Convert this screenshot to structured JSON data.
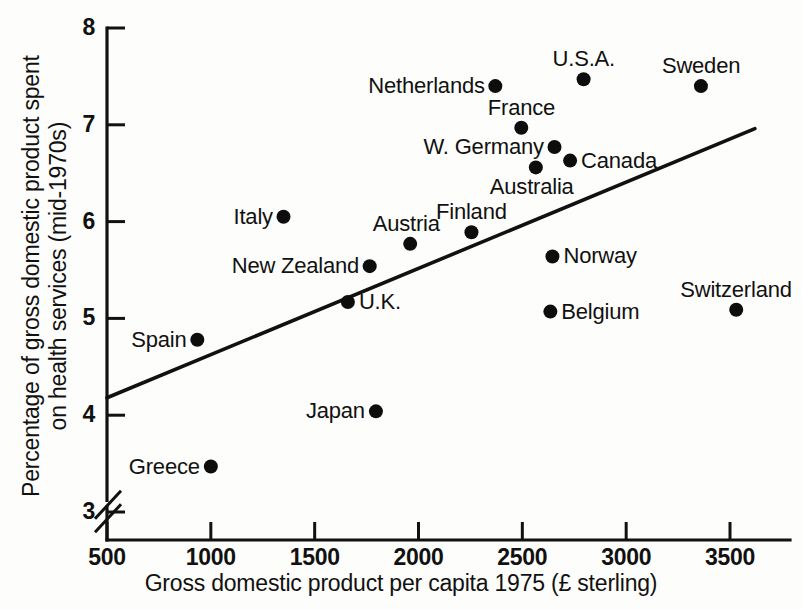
{
  "chart_data": {
    "type": "scatter",
    "title": "",
    "xlabel": "Gross domestic product per capita 1975 (£ sterling)",
    "ylabel": "Percentage of gross domestic product spent on health services (mid-1970s)",
    "ylabel_line1": "Percentage of gross domestic product spent",
    "ylabel_line2": "on health services (mid-1970s)",
    "xlim": [
      500,
      3620
    ],
    "ylim": [
      3,
      8
    ],
    "xticks": [
      500,
      1000,
      1500,
      2000,
      2500,
      3000,
      3500
    ],
    "xtick_labels": [
      "500",
      "1000",
      "1500",
      "2000",
      "2500",
      "3000",
      "3500"
    ],
    "yticks": [
      3,
      4,
      5,
      6,
      7,
      8
    ],
    "ytick_labels": [
      "3",
      "4",
      "5",
      "6",
      "7",
      "8"
    ],
    "y_axis_broken": true,
    "grid": false,
    "legend": "none",
    "points": [
      {
        "label": "Greece",
        "x": 1000,
        "y": 3.47,
        "label_pos": "left"
      },
      {
        "label": "Spain",
        "x": 935,
        "y": 4.78,
        "label_pos": "left"
      },
      {
        "label": "Japan",
        "x": 1795,
        "y": 4.04,
        "label_pos": "left"
      },
      {
        "label": "Belgium",
        "x": 2635,
        "y": 5.07,
        "label_pos": "right"
      },
      {
        "label": "Switzerland",
        "x": 3530,
        "y": 5.09,
        "label_pos": "above"
      },
      {
        "label": "U.K.",
        "x": 1660,
        "y": 5.17,
        "label_pos": "right"
      },
      {
        "label": "New Zealand",
        "x": 1765,
        "y": 5.54,
        "label_pos": "left"
      },
      {
        "label": "Norway",
        "x": 2645,
        "y": 5.64,
        "label_pos": "right"
      },
      {
        "label": "Austria",
        "x": 1960,
        "y": 5.77,
        "label_pos": "above-left"
      },
      {
        "label": "Finland",
        "x": 2255,
        "y": 5.89,
        "label_pos": "above"
      },
      {
        "label": "Italy",
        "x": 1350,
        "y": 6.05,
        "label_pos": "left"
      },
      {
        "label": "Australia",
        "x": 2565,
        "y": 6.56,
        "label_pos": "below-left"
      },
      {
        "label": "Canada",
        "x": 2730,
        "y": 6.63,
        "label_pos": "right"
      },
      {
        "label": "W. Germany",
        "x": 2655,
        "y": 6.77,
        "label_pos": "left"
      },
      {
        "label": "France",
        "x": 2495,
        "y": 6.97,
        "label_pos": "above"
      },
      {
        "label": "Netherlands",
        "x": 2370,
        "y": 7.4,
        "label_pos": "left"
      },
      {
        "label": "U.S.A.",
        "x": 2795,
        "y": 7.47,
        "label_pos": "above"
      },
      {
        "label": "Sweden",
        "x": 3360,
        "y": 7.4,
        "label_pos": "above"
      }
    ],
    "trend_line": {
      "description": "fitted regression line",
      "x_start": 500,
      "y_start": 4.18,
      "x_end": 3620,
      "y_end": 6.96
    },
    "colors": {
      "ink": "#111111",
      "background": "#fdfdfb",
      "point": "#0d0d0d"
    }
  }
}
